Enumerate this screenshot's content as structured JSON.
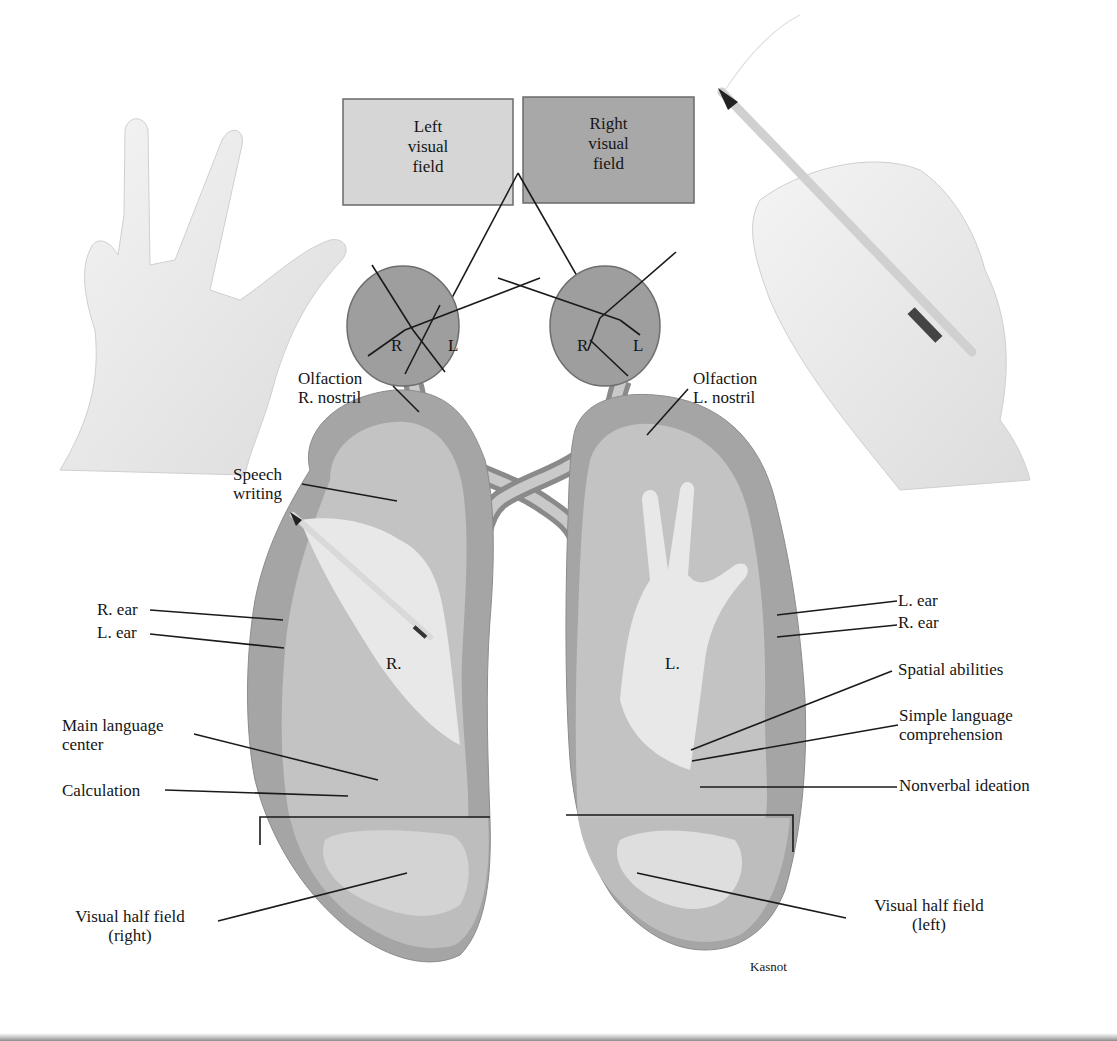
{
  "figure": {
    "signature": "Kasnot",
    "colors": {
      "background": "#ffffff",
      "left_field_box": "#d6d6d6",
      "right_field_box": "#a8a8a8",
      "cortex_dark": "#a3a3a3",
      "cortex_mid": "#bdbdbd",
      "white_matter": "#d2d2d2",
      "visual_area_light": "#e3e3e3",
      "skin": "#ececec",
      "line": "#1a1a1a"
    }
  },
  "visual_fields": {
    "left": {
      "line1": "Left",
      "line2": "visual",
      "line3": "field"
    },
    "right": {
      "line1": "Right",
      "line2": "visual",
      "line3": "field"
    }
  },
  "eyes": {
    "left_eye": {
      "r": "R",
      "l": "L"
    },
    "right_eye": {
      "r": "R",
      "l": "L"
    }
  },
  "hands_in_brain": {
    "right_hand_label": "R.",
    "left_hand_label": "L."
  },
  "labels_left_hemisphere": {
    "olfaction": {
      "line1": "Olfaction",
      "line2": "R. nostril"
    },
    "speech": {
      "line1": "Speech",
      "line2": "writing"
    },
    "r_ear": "R. ear",
    "l_ear": "L. ear",
    "main_language": {
      "line1": "Main language",
      "line2": "center"
    },
    "calculation": "Calculation",
    "visual_half": {
      "line1": "Visual half field",
      "line2": "(right)"
    }
  },
  "labels_right_hemisphere": {
    "olfaction": {
      "line1": "Olfaction",
      "line2": "L. nostril"
    },
    "l_ear": "L. ear",
    "r_ear": "R. ear",
    "spatial": "Spatial abilities",
    "simple_language": {
      "line1": "Simple language",
      "line2": "comprehension"
    },
    "nonverbal": "Nonverbal ideation",
    "visual_half": {
      "line1": "Visual half field",
      "line2": "(left)"
    }
  }
}
